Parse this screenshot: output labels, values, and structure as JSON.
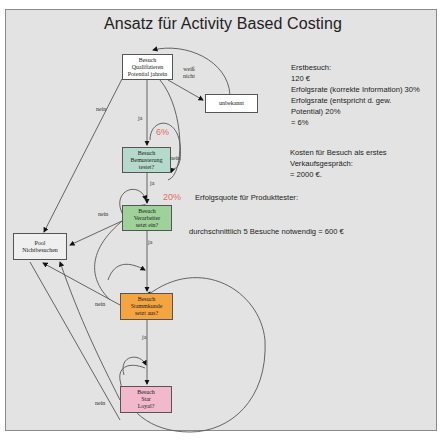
{
  "title": "Ansatz für Activity Based Costing",
  "nodes": {
    "qualify": {
      "label": "Besuch\nQualifizieren\nPotential jahrein",
      "color": "#ffffff"
    },
    "unknown": {
      "label": "unbekannt",
      "color": "#ffffff"
    },
    "sample": {
      "label": "Besuch\nBemusterung\ntestet?",
      "color": "#b5d9cb"
    },
    "processor": {
      "label": "Besuch\nVerarbeiter\nsetzt ein?",
      "color": "#9fd19a"
    },
    "pool": {
      "label": "Pool\nNichtbesuchen",
      "color": "#efefef"
    },
    "regular": {
      "label": "Besuch\nStammkunde\nsetzt aus?",
      "color": "#f5a540"
    },
    "star": {
      "label": "Besuch\nStar\nLoyal?",
      "color": "#f2b8cc"
    }
  },
  "edge_labels": {
    "weiss_nicht": "weiß\nnicht",
    "nein_top": "nein",
    "ja_1": "ja",
    "nein_sample": "nein",
    "ja_2": "ja",
    "nein_processor": "nein",
    "ja_3": "ja",
    "nein_regular": "nein",
    "ja_4": "ja",
    "nein_star": "nein"
  },
  "percentages": {
    "sample": "6%",
    "processor": "20%"
  },
  "notes": {
    "first_visit": "Erstbesuch:\n120 €\nErfolgsrate (korrekte Information) 30%\nErfolgsrate (entspricht d. gew.\nPotential) 20%\n= 6%",
    "cost_first_sales": "Kosten für Besuch als erstes\nVerkaufsgespräch:\n= 2000 €.",
    "success_rate_tester": "Erfolgsquote für Produkttester:",
    "average_visits": "durchschnittlich 5 Besuche notwendig = 600 €"
  }
}
